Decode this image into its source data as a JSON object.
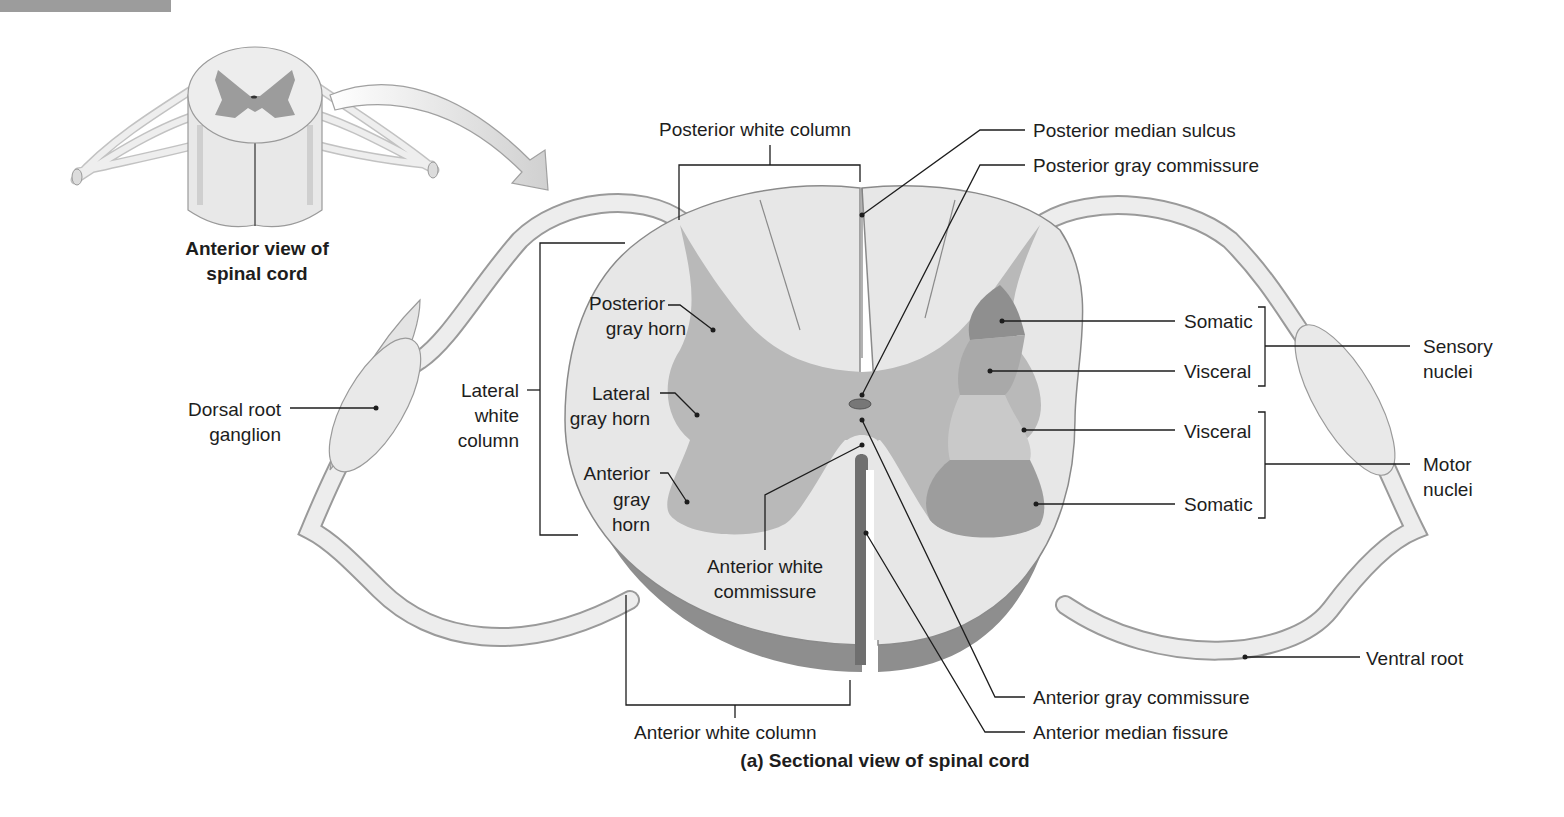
{
  "header_bar": {
    "color": "#9c9c9c"
  },
  "inset": {
    "caption_line1": "Anterior view of",
    "caption_line2": "spinal cord"
  },
  "caption": "(a) Sectional view of spinal cord",
  "colors": {
    "white_matter": "#e6e6e6",
    "gray_matter": "#b9b9b9",
    "somatic_sensory": "#8f8f8f",
    "visceral_sensory": "#a9a9a9",
    "visceral_motor": "#c9c9c9",
    "somatic_motor": "#9d9d9d",
    "cord_edge": "#8a8a8a",
    "leader_line": "#1d1d1d"
  },
  "labels": {
    "posterior_white_column": "Posterior white column",
    "posterior_median_sulcus": "Posterior median sulcus",
    "posterior_gray_commissure": "Posterior gray commissure",
    "posterior_gray_horn_1": "Posterior",
    "posterior_gray_horn_2": "gray horn",
    "lateral_gray_horn_1": "Lateral",
    "lateral_gray_horn_2": "gray horn",
    "anterior_gray_horn_1": "Anterior",
    "anterior_gray_horn_2": "gray",
    "anterior_gray_horn_3": "horn",
    "lateral_white_column_1": "Lateral",
    "lateral_white_column_2": "white",
    "lateral_white_column_3": "column",
    "dorsal_root_ganglion_1": "Dorsal root",
    "dorsal_root_ganglion_2": "ganglion",
    "anterior_white_commissure_1": "Anterior white",
    "anterior_white_commissure_2": "commissure",
    "anterior_white_column": "Anterior white column",
    "anterior_gray_commissure": "Anterior gray commissure",
    "anterior_median_fissure": "Anterior median fissure",
    "ventral_root": "Ventral root",
    "somatic_sensory": "Somatic",
    "visceral_sensory": "Visceral",
    "visceral_motor": "Visceral",
    "somatic_motor": "Somatic",
    "sensory_nuclei_1": "Sensory",
    "sensory_nuclei_2": "nuclei",
    "motor_nuclei_1": "Motor",
    "motor_nuclei_2": "nuclei"
  }
}
